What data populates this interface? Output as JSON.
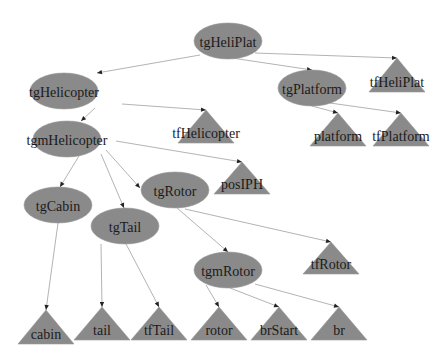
{
  "diagram": {
    "type": "scene-graph-tree",
    "colors": {
      "node_fill": "#8a8a8a",
      "edge": "#a0a0a0",
      "arrowhead": "#222222",
      "label": "#1a1a1a",
      "background": "#ffffff"
    },
    "group_nodes": [
      {
        "id": "tgHeliPlat",
        "label": "tgHeliPlat",
        "cx": 228,
        "cy": 41
      },
      {
        "id": "tgHelicopter",
        "label": "tgHelicopter",
        "cx": 64,
        "cy": 91
      },
      {
        "id": "tgPlatform",
        "label": "tgPlatform",
        "cx": 312,
        "cy": 88
      },
      {
        "id": "tgmHelicopter",
        "label": "tgmHelicopter",
        "cx": 67,
        "cy": 139
      },
      {
        "id": "tgRotor",
        "label": "tgRotor",
        "cx": 175,
        "cy": 190
      },
      {
        "id": "tgCabin",
        "label": "tgCabin",
        "cx": 58,
        "cy": 205
      },
      {
        "id": "tgTail",
        "label": "tgTail",
        "cx": 125,
        "cy": 226
      },
      {
        "id": "tgmRotor",
        "label": "tgmRotor",
        "cx": 228,
        "cy": 270
      }
    ],
    "leaf_nodes": [
      {
        "id": "tfHeliPlat",
        "label": "tfHeliPlat",
        "ax": 397,
        "ay": 58,
        "by": 92
      },
      {
        "id": "tfHelicopter",
        "label": "tfHelicopter",
        "ax": 206,
        "ay": 110,
        "by": 143
      },
      {
        "id": "platform",
        "label": "platform",
        "ax": 338,
        "ay": 113,
        "by": 146
      },
      {
        "id": "tfPlatform",
        "label": "tfPlatform",
        "ax": 401,
        "ay": 113,
        "by": 146
      },
      {
        "id": "posIPH",
        "label": "posIPH",
        "ax": 242,
        "ay": 162,
        "by": 194
      },
      {
        "id": "tfRotor",
        "label": "tfRotor",
        "ax": 331,
        "ay": 242,
        "by": 274
      },
      {
        "id": "cabin",
        "label": "cabin",
        "ax": 46,
        "ay": 310,
        "by": 344
      },
      {
        "id": "tail",
        "label": "tail",
        "ax": 102,
        "ay": 307,
        "by": 340
      },
      {
        "id": "tfTail",
        "label": "tfTail",
        "ax": 159,
        "ay": 307,
        "by": 340
      },
      {
        "id": "rotor",
        "label": "rotor",
        "ax": 219,
        "ay": 307,
        "by": 340
      },
      {
        "id": "brStart",
        "label": "brStart",
        "ax": 279,
        "ay": 307,
        "by": 340
      },
      {
        "id": "br",
        "label": "br",
        "ax": 339,
        "ay": 307,
        "by": 340
      }
    ],
    "edges": [
      {
        "from": "tgHeliPlat",
        "to": "tgHelicopter",
        "x1": 200,
        "y1": 55,
        "x2": 97,
        "y2": 73
      },
      {
        "from": "tgHeliPlat",
        "to": "tgPlatform",
        "x1": 232,
        "y1": 58,
        "x2": 312,
        "y2": 70
      },
      {
        "from": "tgHeliPlat",
        "to": "tfHeliPlat",
        "x1": 255,
        "y1": 53,
        "x2": 397,
        "y2": 58
      },
      {
        "from": "tgHelicopter",
        "to": "tgmHelicopter",
        "x1": 95,
        "y1": 108,
        "x2": 81,
        "y2": 121
      },
      {
        "from": "tgHelicopter",
        "to": "tfHelicopter",
        "x1": 122,
        "y1": 104,
        "x2": 206,
        "y2": 110
      },
      {
        "from": "tgPlatform",
        "to": "platform",
        "x1": 312,
        "y1": 106,
        "x2": 338,
        "y2": 113
      },
      {
        "from": "tgPlatform",
        "to": "tfPlatform",
        "x1": 330,
        "y1": 103,
        "x2": 401,
        "y2": 113
      },
      {
        "from": "tgmHelicopter",
        "to": "posIPH",
        "x1": 116,
        "y1": 141,
        "x2": 242,
        "y2": 162
      },
      {
        "from": "tgmHelicopter",
        "to": "tgCabin",
        "x1": 79,
        "y1": 156,
        "x2": 60,
        "y2": 187
      },
      {
        "from": "tgmHelicopter",
        "to": "tgTail",
        "x1": 101,
        "y1": 154,
        "x2": 124,
        "y2": 208
      },
      {
        "from": "tgmHelicopter",
        "to": "tgRotor",
        "x1": 106,
        "y1": 150,
        "x2": 140,
        "y2": 188
      },
      {
        "from": "tgCabin",
        "to": "cabin",
        "x1": 58,
        "y1": 223,
        "x2": 46,
        "y2": 310
      },
      {
        "from": "tgTail",
        "to": "tail",
        "x1": 101,
        "y1": 244,
        "x2": 102,
        "y2": 307
      },
      {
        "from": "tgTail",
        "to": "tfTail",
        "x1": 126,
        "y1": 244,
        "x2": 159,
        "y2": 307
      },
      {
        "from": "tgRotor",
        "to": "tgmRotor",
        "x1": 177,
        "y1": 208,
        "x2": 228,
        "y2": 252
      },
      {
        "from": "tgRotor",
        "to": "tfRotor",
        "x1": 185,
        "y1": 209,
        "x2": 331,
        "y2": 242
      },
      {
        "from": "tgmRotor",
        "to": "rotor",
        "x1": 206,
        "y1": 285,
        "x2": 219,
        "y2": 307
      },
      {
        "from": "tgmRotor",
        "to": "brStart",
        "x1": 230,
        "y1": 288,
        "x2": 279,
        "y2": 307
      },
      {
        "from": "tgmRotor",
        "to": "br",
        "x1": 255,
        "y1": 284,
        "x2": 339,
        "y2": 307
      }
    ]
  }
}
